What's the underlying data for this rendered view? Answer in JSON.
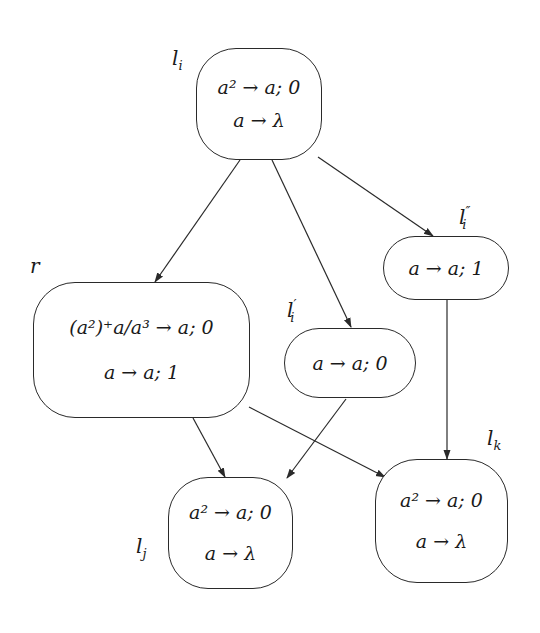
{
  "diagram": {
    "nodes": [
      {
        "id": "li",
        "label": "l_i",
        "label_display": "l",
        "label_sub": "i",
        "label_prime": "",
        "rules": [
          "a² → a; 0",
          "a → λ"
        ]
      },
      {
        "id": "r",
        "label": "r",
        "label_display": "r",
        "label_sub": "",
        "label_prime": "",
        "rules": [
          "(a²)⁺a/a³ → a; 0",
          "a → a; 1"
        ]
      },
      {
        "id": "li_prime",
        "label": "l'_i",
        "label_display": "l",
        "label_sub": "i",
        "label_prime": "′",
        "rules": [
          "a → a; 0"
        ]
      },
      {
        "id": "li_dprime",
        "label": "l''_i",
        "label_display": "l",
        "label_sub": "i",
        "label_prime": "″",
        "rules": [
          "a → a; 1"
        ]
      },
      {
        "id": "lj",
        "label": "l_j",
        "label_display": "l",
        "label_sub": "j",
        "label_prime": "",
        "rules": [
          "a² → a; 0",
          "a → λ"
        ]
      },
      {
        "id": "lk",
        "label": "l_k",
        "label_display": "l",
        "label_sub": "k",
        "label_prime": "",
        "rules": [
          "a² → a; 0",
          "a → λ"
        ]
      }
    ],
    "edges": [
      {
        "from": "li",
        "to": "r"
      },
      {
        "from": "li",
        "to": "li_prime"
      },
      {
        "from": "li",
        "to": "li_dprime"
      },
      {
        "from": "r",
        "to": "lj"
      },
      {
        "from": "r",
        "to": "lk"
      },
      {
        "from": "li_prime",
        "to": "lj"
      },
      {
        "from": "li_dprime",
        "to": "lk"
      }
    ],
    "colors": {
      "stroke": "#2a2a2a",
      "background": "#ffffff"
    }
  }
}
